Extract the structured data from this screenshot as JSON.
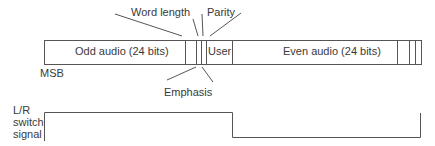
{
  "labels": {
    "word_length": "Word length",
    "parity": "Parity",
    "emphasis": "Emphasis",
    "msb": "MSB",
    "signal_line1": "L/R",
    "signal_line2": "switch",
    "signal_line3": "signal"
  },
  "frame": {
    "fields": [
      {
        "name": "odd-audio",
        "label": "Odd audio (24 bits)"
      },
      {
        "name": "word-length-bits",
        "label": ""
      },
      {
        "name": "emphasis-bit",
        "label": ""
      },
      {
        "name": "parity-bit",
        "label": ""
      },
      {
        "name": "user",
        "label": "User"
      },
      {
        "name": "even-audio",
        "label": "Even audio (24 bits)"
      },
      {
        "name": "trailing-bit-1",
        "label": ""
      },
      {
        "name": "trailing-bit-2",
        "label": ""
      },
      {
        "name": "trailing-bit-3",
        "label": ""
      }
    ]
  },
  "colors": {
    "line": "#555555",
    "text": "#3a3a3a",
    "background": "#ffffff"
  }
}
